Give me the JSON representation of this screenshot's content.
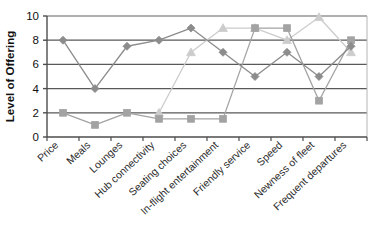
{
  "chart_data": {
    "type": "line",
    "title": "",
    "subtitle": "",
    "xlabel": "",
    "ylabel": "Level of Offering",
    "ylim": [
      0,
      10
    ],
    "yticks": [
      0,
      2,
      4,
      6,
      8,
      10
    ],
    "grid": "horizontal",
    "legend": "none",
    "categories": [
      "Price",
      "Meals",
      "Lounges",
      "Hub connectivity",
      "Seating choices",
      "In-flight entertainment",
      "Friendly service",
      "Speed",
      "Newness of fleet",
      "Frequent departures"
    ],
    "series": [
      {
        "name": "series-1",
        "marker": "diamond",
        "color": "#8c8c8c",
        "values": [
          8,
          4,
          7.5,
          8,
          9,
          7,
          5,
          7,
          5,
          7.5
        ]
      },
      {
        "name": "series-2",
        "marker": "square",
        "color": "#a3a3a3",
        "values": [
          2,
          1,
          2,
          1.5,
          1.5,
          1.5,
          9,
          9,
          3,
          8
        ]
      },
      {
        "name": "series-3",
        "marker": "triangle",
        "color": "#cccccc",
        "values": [
          null,
          null,
          null,
          2,
          7,
          9,
          9,
          8,
          9.9,
          7
        ]
      }
    ]
  },
  "axis": {
    "y_tick_labels": [
      "0",
      "2",
      "4",
      "6",
      "8",
      "10"
    ],
    "y_axis_title": "Level of Offering"
  },
  "colors": {
    "axis": "#4d4d4d",
    "gridline": "#595959",
    "frame": "#b5b5b5",
    "background": "#ffffff",
    "series_1": "#8c8c8c",
    "series_2": "#a3a3a3",
    "series_3": "#cccccc"
  }
}
